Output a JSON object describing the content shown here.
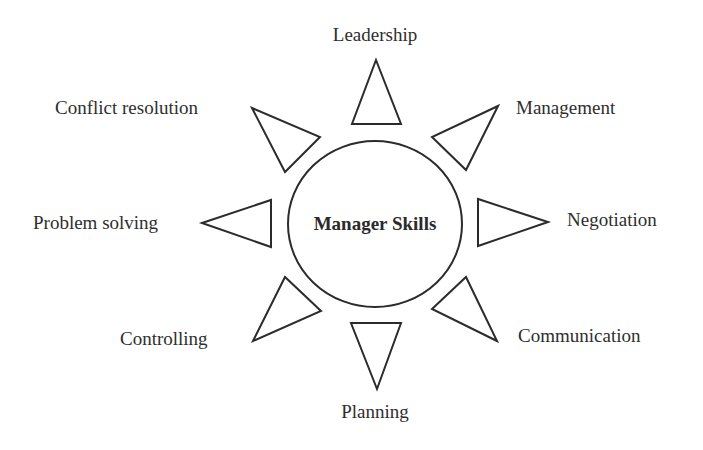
{
  "diagram": {
    "title": "Manager Skills",
    "center": {
      "label": "Manager Skills",
      "shape": "circle"
    },
    "spokes": [
      {
        "id": "leadership",
        "label": "Leadership",
        "direction": "up"
      },
      {
        "id": "management",
        "label": "Management",
        "direction": "up-right"
      },
      {
        "id": "negotiation",
        "label": "Negotiation",
        "direction": "right"
      },
      {
        "id": "communication",
        "label": "Communication",
        "direction": "down-right"
      },
      {
        "id": "planning",
        "label": "Planning",
        "direction": "down"
      },
      {
        "id": "controlling",
        "label": "Controlling",
        "direction": "down-left"
      },
      {
        "id": "problem-solving",
        "label": "Problem solving",
        "direction": "left"
      },
      {
        "id": "conflict-resolution",
        "label": "Conflict resolution",
        "direction": "up-left"
      }
    ],
    "colors": {
      "stroke": "#2b2b2b",
      "fill": "#ffffff",
      "text": "#2e2e2e",
      "background": "#ffffff"
    }
  }
}
